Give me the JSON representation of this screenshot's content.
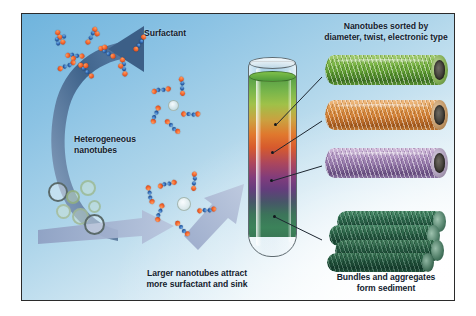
{
  "figure": {
    "kind": "scientific-illustration",
    "background_colors": {
      "top_left": "#6fb4dd",
      "bottom_right": "#ffffff",
      "border": "#2b2b2b"
    }
  },
  "labels": {
    "surfactant": "Surfactant",
    "heterogeneous_nanotubes": "Heterogeneous\nnanotubes",
    "larger_nanotubes": "Larger nanotubes attract\nmore surfactant and sink",
    "sorted_title": "Nanotubes sorted by\ndiameter, twist, electronic type",
    "bundles": "Bundles and aggregates\nform sediment"
  },
  "tube": {
    "name": "centrifuge-tube",
    "layers": [
      {
        "name": "green-layer",
        "color": "#4e9a3a",
        "label_target": "green-nanotube"
      },
      {
        "name": "orange-layer",
        "color": "#e2701f",
        "label_target": "orange-nanotube"
      },
      {
        "name": "purple-layer",
        "color": "#7a2f73",
        "label_target": "purple-nanotube"
      },
      {
        "name": "sediment-layer",
        "color": "#2f7a4e",
        "label_target": "nanotube-bundle"
      }
    ]
  },
  "nanotubes": [
    {
      "name": "green-nanotube",
      "color": "#6fa83c",
      "tint": "#8fc256"
    },
    {
      "name": "orange-nanotube",
      "color": "#d98a42",
      "tint": "#e8a868"
    },
    {
      "name": "purple-nanotube",
      "color": "#9a7fa8",
      "tint": "#b9a2c4"
    },
    {
      "name": "bundle-nanotube",
      "color": "#2d6b4f",
      "tint": "#3f8a66"
    }
  ],
  "arrows": [
    {
      "name": "surfactant-to-nanotubes-arrow",
      "color": "#3c5f87",
      "direction": "curved-down-left"
    },
    {
      "name": "mixing-arrow",
      "color": "#9aa9c9",
      "direction": "right"
    },
    {
      "name": "to-tube-arrow",
      "color": "#9aa9c9",
      "direction": "up-right"
    }
  ],
  "molecule": {
    "head_color": "#f0602a",
    "tail_color": "#2a5fa8"
  }
}
